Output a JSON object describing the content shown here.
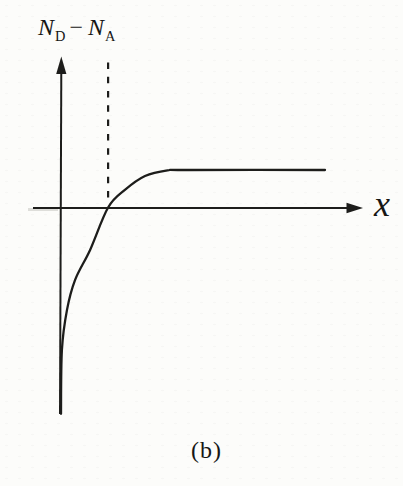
{
  "figure": {
    "background": "#fcfcfa",
    "ink_color": "#1d1d1b",
    "text_color": "#161614"
  },
  "labels": {
    "y_axis": {
      "full": "N_D − N_A",
      "term1_base": "N",
      "term1_sub": "D",
      "operator": "−",
      "term2_base": "N",
      "term2_sub": "A"
    },
    "x_axis": "x",
    "caption": "(b)"
  },
  "chart_data": {
    "type": "line",
    "title": "",
    "xlabel": "x",
    "ylabel": "N_D − N_A",
    "caption": "(b)",
    "x_range": [
      0,
      10
    ],
    "y_range": [
      -6,
      4
    ],
    "axes": {
      "x_arrow": true,
      "y_arrow": true,
      "ticks": false,
      "grid": false,
      "tick_labels": false
    },
    "series": [
      {
        "name": "net-doping-profile",
        "style": "solid",
        "zero_crossing_x": 1.57,
        "saturation_value": 1.0,
        "points": [
          [
            0.0,
            -5.5
          ],
          [
            0.03,
            -3.8
          ],
          [
            0.2,
            -2.73
          ],
          [
            0.47,
            -1.93
          ],
          [
            0.97,
            -1.13
          ],
          [
            1.57,
            0.0
          ],
          [
            2.13,
            0.47
          ],
          [
            2.8,
            0.84
          ],
          [
            3.55,
            0.99
          ],
          [
            4.2,
            1.0
          ],
          [
            8.8,
            1.0
          ]
        ]
      }
    ],
    "annotations": [
      {
        "type": "vline",
        "style": "dashed",
        "x": 1.57,
        "y_from": 0.15,
        "y_to": 3.87
      }
    ]
  }
}
